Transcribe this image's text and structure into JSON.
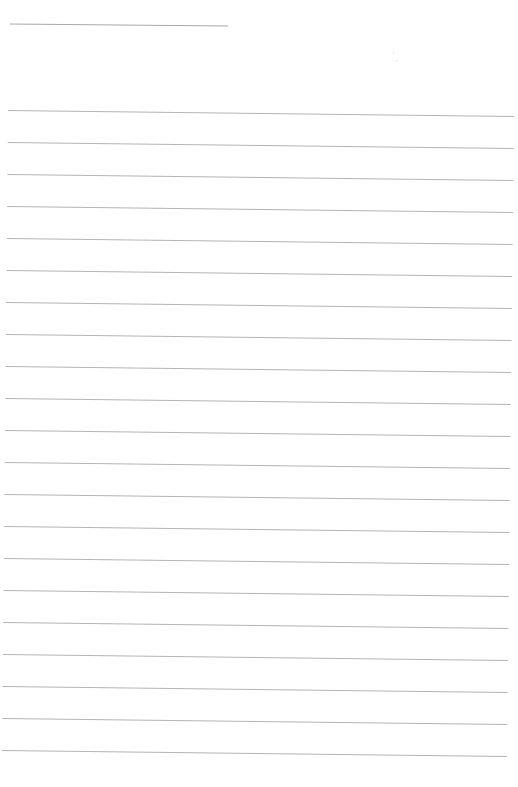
{
  "page": {
    "type": "lined-paper",
    "background": "#ffffff",
    "rule_color": "#b4b4b4",
    "title_line": {
      "x1": 10,
      "y1": 24,
      "x2": 228,
      "y2": 26
    },
    "rules": {
      "count": 21,
      "start_y_left": 110,
      "spacing": 32,
      "slope_px": 6,
      "x_start_top": 8,
      "x_end_top": 514,
      "x_start_bottom": 2,
      "x_end_bottom": 507
    },
    "text_content": ""
  }
}
